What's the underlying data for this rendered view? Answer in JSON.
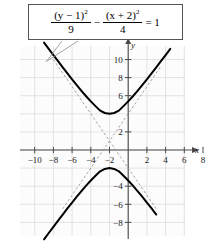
{
  "figure": {
    "name": "hyperbola-graph",
    "equation": {
      "numerator_1": "(y − 1)",
      "numerator_1_exp": "2",
      "denominator_1": "9",
      "operator": "−",
      "numerator_2": "(x + 2)",
      "numerator_2_exp": "2",
      "denominator_2": "4",
      "equals": "= 1",
      "plain": "(y - 1)^2/9 - (x + 2)^2/4 = 1"
    },
    "axis_names": {
      "x": "x",
      "y": "y"
    },
    "colors": {
      "curve": "#000000",
      "asymptote": "#8c8c8c",
      "grid": "#d8d8dc",
      "axis": "#4a4a4a",
      "leader": "#9a9a9a",
      "box_border": "#555555",
      "plot_background": "#fcfcfd"
    }
  },
  "chart_data": {
    "type": "line",
    "title": "",
    "subtitle": "",
    "xlabel": "x",
    "ylabel": "y",
    "xlim": [
      -11,
      9
    ],
    "ylim": [
      -9.5,
      11.5
    ],
    "grid": true,
    "legend": "none",
    "xticks": [
      -10,
      -8,
      -6,
      -4,
      -2,
      2,
      4,
      6,
      8
    ],
    "xticklabels": [
      "−10",
      "−8",
      "−6",
      "−4",
      "−2",
      "2",
      "4",
      "6",
      "8"
    ],
    "yticks": [
      10,
      8,
      6,
      2,
      -4,
      -6,
      -8
    ],
    "yticklabels": [
      "10",
      "8",
      "6",
      "2",
      "−4",
      "−6",
      "−8"
    ],
    "center": [
      -2,
      1
    ],
    "a_semi_transverse": 3,
    "b_semi_conjugate": 2,
    "orientation": "vertical",
    "vertices": [
      [
        -2,
        4
      ],
      [
        -2,
        -2
      ]
    ],
    "annotations": [
      {
        "text": "(y − 1)^2/9 − (x + 2)^2/4 = 1",
        "target": [
          -6.6,
          9.2
        ]
      }
    ],
    "series": [
      {
        "name": "upper branch",
        "style": "solid",
        "x": [
          -9.0,
          -8.5,
          -8.0,
          -7.5,
          -7.0,
          -6.5,
          -6.0,
          -5.5,
          -5.0,
          -4.5,
          -4.0,
          -3.5,
          -3.0,
          -2.5,
          -2.0,
          -1.5,
          -1.0,
          -0.5,
          0.0,
          0.5,
          1.0,
          1.5,
          2.0,
          2.5,
          3.0,
          3.5,
          4.0,
          4.5
        ],
        "y": [
          11.87,
          11.17,
          10.49,
          9.81,
          9.13,
          8.46,
          7.81,
          7.16,
          6.54,
          5.94,
          5.37,
          4.85,
          4.35,
          4.09,
          4.0,
          4.09,
          4.35,
          4.85,
          5.37,
          5.94,
          6.54,
          7.16,
          7.81,
          8.46,
          9.13,
          9.81,
          10.49,
          11.17
        ]
      },
      {
        "name": "lower branch",
        "style": "solid",
        "x": [
          -9.0,
          -8.5,
          -8.0,
          -7.5,
          -7.0,
          -6.5,
          -6.0,
          -5.5,
          -5.0,
          -4.5,
          -4.0,
          -3.5,
          -3.0,
          -2.5,
          -2.0,
          -1.5,
          -1.0,
          -0.5,
          0.0,
          0.5,
          1.0,
          1.5,
          2.0,
          2.5,
          3.0
        ],
        "y": [
          -9.87,
          -9.17,
          -8.49,
          -7.81,
          -7.13,
          -6.46,
          -5.81,
          -5.16,
          -4.54,
          -3.94,
          -3.37,
          -2.85,
          -2.35,
          -2.09,
          -2.0,
          -2.09,
          -2.35,
          -2.85,
          -3.37,
          -3.94,
          -4.54,
          -5.16,
          -5.81,
          -6.46,
          -7.13
        ]
      },
      {
        "name": "asymptote positive slope",
        "style": "dashed",
        "slope": 1.5,
        "x": [
          -7.0,
          3.5
        ],
        "y": [
          -6.5,
          9.25
        ]
      },
      {
        "name": "asymptote negative slope",
        "style": "dashed",
        "slope": -1.5,
        "x": [
          -8.0,
          3.0
        ],
        "y": [
          10.0,
          -6.5
        ]
      }
    ]
  }
}
